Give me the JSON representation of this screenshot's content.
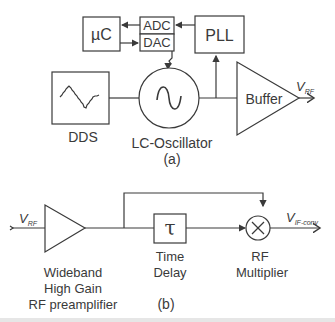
{
  "diagram_a": {
    "caption": "(a)",
    "blocks": {
      "uc": "µC",
      "adc": "ADC",
      "dac": "DAC",
      "pll": "PLL",
      "dds": "DDS",
      "oscillator": "LC-Oscillator",
      "buffer": "Buffer"
    },
    "output": {
      "v": "V",
      "sub": "RF"
    }
  },
  "diagram_b": {
    "caption": "(b)",
    "input": {
      "v": "V",
      "sub": "RF"
    },
    "output": {
      "v": "V",
      "sub": "IF-conv"
    },
    "delay_symbol": "τ",
    "labels": {
      "preamp_line1": "Wideband",
      "preamp_line2": "High Gain",
      "preamp_line3": "RF preamplifier",
      "delay_line1": "Time",
      "delay_line2": "Delay",
      "mult_line1": "RF",
      "mult_line2": "Multiplier"
    }
  },
  "colors": {
    "stroke": "#3a3a3a",
    "background": "#ffffff"
  }
}
